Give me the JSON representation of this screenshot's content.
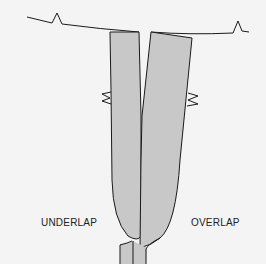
{
  "diagram": {
    "labels": {
      "left": "UNDERLAP",
      "right": "OVERLAP"
    },
    "colors": {
      "background": "#f4f4f4",
      "fill": "#c8c8c8",
      "stroke": "#1a1a1a"
    }
  }
}
